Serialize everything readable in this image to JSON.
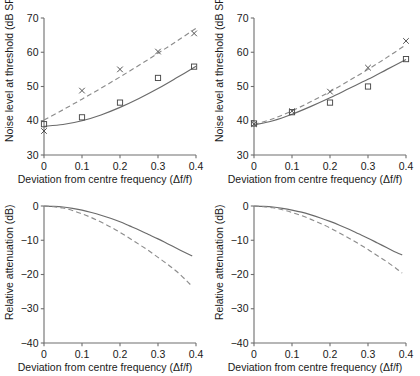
{
  "figure": {
    "panel_count": 4,
    "background": "#ffffff",
    "ink": "#1a1a1a"
  },
  "axes": {
    "x_title": "Deviation from centre frequency (Δf/f)",
    "y_title_top": "Noise level at threshold (dB SPL)",
    "y_title_bottom": "Relative attenuation (dB)",
    "x_ticks": [
      "0",
      "0.1",
      "0.2",
      "0.3",
      "0.4"
    ],
    "y_ticks_top": [
      "70",
      "60",
      "50",
      "40",
      "30"
    ],
    "y_ticks_bottom": [
      "0",
      "−10",
      "−20",
      "−30",
      "−40"
    ]
  },
  "chart_data": [
    {
      "type": "scatter",
      "panel": "top-left",
      "title": "",
      "xlabel": "Deviation from centre frequency (Δf/f)",
      "ylabel": "Noise level at threshold (dB SPL)",
      "xlim": [
        0,
        0.4
      ],
      "ylim": [
        30,
        70
      ],
      "xticks": [
        0,
        0.1,
        0.2,
        0.3,
        0.4
      ],
      "yticks": [
        30,
        40,
        50,
        60,
        70
      ],
      "grid": false,
      "legend": "none",
      "series": [
        {
          "name": "square-markers",
          "marker": "square",
          "linestyle": "solid",
          "x": [
            0,
            0.1,
            0.2,
            0.3,
            0.395
          ],
          "values": [
            39.0,
            41.0,
            45.3,
            52.5,
            55.8
          ]
        },
        {
          "name": "cross-markers",
          "marker": "x",
          "linestyle": "dashed",
          "x": [
            0,
            0.1,
            0.2,
            0.3,
            0.395
          ],
          "values": [
            37.0,
            48.8,
            55.0,
            60.2,
            65.5
          ]
        }
      ],
      "fits": [
        {
          "name": "solid-fit",
          "linestyle": "solid",
          "x": [
            0,
            0.05,
            0.1,
            0.15,
            0.2,
            0.25,
            0.3,
            0.35,
            0.4
          ],
          "y": [
            38.4,
            38.9,
            40.0,
            41.7,
            43.9,
            46.5,
            49.4,
            52.6,
            55.9
          ]
        },
        {
          "name": "dashed-fit",
          "linestyle": "dashed",
          "x": [
            0,
            0.05,
            0.1,
            0.15,
            0.2,
            0.25,
            0.3,
            0.35,
            0.4
          ],
          "y": [
            40.2,
            43.2,
            46.3,
            49.5,
            52.8,
            56.2,
            59.7,
            63.3,
            67.0
          ]
        }
      ]
    },
    {
      "type": "scatter",
      "panel": "top-right",
      "title": "",
      "xlabel": "Deviation from centre frequency (Δf/f)",
      "ylabel": "Noise level at threshold (dB SPL)",
      "xlim": [
        0,
        0.4
      ],
      "ylim": [
        30,
        70
      ],
      "xticks": [
        0,
        0.1,
        0.2,
        0.3,
        0.4
      ],
      "yticks": [
        30,
        40,
        50,
        60,
        70
      ],
      "grid": false,
      "legend": "none",
      "series": [
        {
          "name": "square-markers",
          "marker": "square",
          "linestyle": "solid",
          "x": [
            0,
            0.1,
            0.2,
            0.3,
            0.4
          ],
          "values": [
            39.2,
            42.5,
            45.3,
            50.0,
            58.0
          ]
        },
        {
          "name": "cross-markers",
          "marker": "x",
          "linestyle": "dashed",
          "x": [
            0,
            0.1,
            0.2,
            0.3,
            0.4
          ],
          "values": [
            39.0,
            42.8,
            48.5,
            55.5,
            63.3
          ]
        }
      ],
      "fits": [
        {
          "name": "solid-fit",
          "linestyle": "solid",
          "x": [
            0,
            0.05,
            0.1,
            0.15,
            0.2,
            0.25,
            0.3,
            0.35,
            0.4
          ],
          "y": [
            38.8,
            40.0,
            41.9,
            44.2,
            46.7,
            49.4,
            52.1,
            55.0,
            57.9
          ]
        },
        {
          "name": "dashed-fit",
          "linestyle": "dashed",
          "x": [
            0,
            0.05,
            0.1,
            0.15,
            0.2,
            0.25,
            0.3,
            0.35,
            0.4
          ],
          "y": [
            38.9,
            40.6,
            42.9,
            45.6,
            48.5,
            51.7,
            55.0,
            58.5,
            62.2
          ]
        }
      ]
    },
    {
      "type": "line",
      "panel": "bottom-left",
      "title": "",
      "xlabel": "Deviation from centre frequency (Δf/f)",
      "ylabel": "Relative attenuation (dB)",
      "xlim": [
        0,
        0.4
      ],
      "ylim": [
        -40,
        0
      ],
      "xticks": [
        0,
        0.1,
        0.2,
        0.3,
        0.4
      ],
      "yticks": [
        -40,
        -30,
        -20,
        -10,
        0
      ],
      "grid": false,
      "legend": "none",
      "series": [
        {
          "name": "solid-filter",
          "linestyle": "solid",
          "x": [
            0,
            0.025,
            0.05,
            0.075,
            0.1,
            0.125,
            0.15,
            0.175,
            0.2,
            0.225,
            0.25,
            0.275,
            0.3,
            0.325,
            0.35,
            0.375,
            0.39
          ],
          "values": [
            0,
            -0.1,
            -0.3,
            -0.7,
            -1.2,
            -1.9,
            -2.7,
            -3.6,
            -4.6,
            -5.8,
            -7.0,
            -8.3,
            -9.6,
            -11.0,
            -12.4,
            -13.8,
            -14.6
          ]
        },
        {
          "name": "dashed-filter",
          "linestyle": "dashed",
          "x": [
            0,
            0.025,
            0.05,
            0.075,
            0.1,
            0.125,
            0.15,
            0.175,
            0.2,
            0.225,
            0.25,
            0.275,
            0.3,
            0.325,
            0.35,
            0.375,
            0.39
          ],
          "values": [
            0,
            -0.2,
            -0.6,
            -1.3,
            -2.3,
            -3.4,
            -4.7,
            -6.1,
            -7.7,
            -9.4,
            -11.2,
            -13.0,
            -15.0,
            -17.0,
            -19.2,
            -21.8,
            -23.5
          ]
        }
      ]
    },
    {
      "type": "line",
      "panel": "bottom-right",
      "title": "",
      "xlabel": "Deviation from centre frequency (Δf/f)",
      "ylabel": "Relative attenuation (dB)",
      "xlim": [
        0,
        0.4
      ],
      "ylim": [
        -40,
        0
      ],
      "xticks": [
        0,
        0.1,
        0.2,
        0.3,
        0.4
      ],
      "yticks": [
        -40,
        -30,
        -20,
        -10,
        0
      ],
      "grid": false,
      "legend": "none",
      "series": [
        {
          "name": "solid-filter",
          "linestyle": "solid",
          "x": [
            0,
            0.025,
            0.05,
            0.075,
            0.1,
            0.125,
            0.15,
            0.175,
            0.2,
            0.225,
            0.25,
            0.275,
            0.3,
            0.325,
            0.35,
            0.375,
            0.39
          ],
          "values": [
            0,
            -0.1,
            -0.3,
            -0.7,
            -1.2,
            -1.8,
            -2.6,
            -3.5,
            -4.5,
            -5.6,
            -6.8,
            -8.1,
            -9.4,
            -10.8,
            -12.2,
            -13.6,
            -14.3
          ]
        },
        {
          "name": "dashed-filter",
          "linestyle": "dashed",
          "x": [
            0,
            0.025,
            0.05,
            0.075,
            0.1,
            0.125,
            0.15,
            0.175,
            0.2,
            0.225,
            0.25,
            0.275,
            0.3,
            0.325,
            0.35,
            0.375,
            0.39
          ],
          "values": [
            0,
            -0.2,
            -0.5,
            -1.1,
            -1.9,
            -2.8,
            -3.9,
            -5.1,
            -6.4,
            -7.9,
            -9.4,
            -11.0,
            -12.7,
            -14.5,
            -16.3,
            -18.3,
            -19.6
          ]
        }
      ]
    }
  ]
}
